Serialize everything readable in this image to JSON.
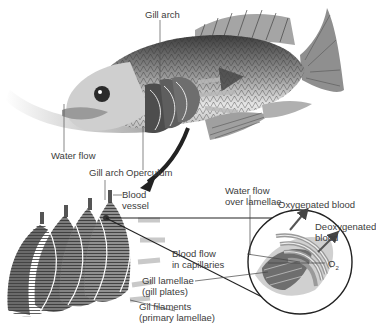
{
  "diagram": {
    "color_scheme": "grayscale",
    "top_cut_text": "fish ... wheels ... and ... gills",
    "labels": {
      "gill_arch_top": "Gill arch",
      "water_flow": "Water flow",
      "operculum": "Operculum",
      "gill_arch_bottom": "Gill arch",
      "blood_vessel_line1": "Blood",
      "blood_vessel_line2": "vessel",
      "water_flow_lamellae_line1": "Water flow",
      "water_flow_lamellae_line2": "over lamellae",
      "oxygenated_blood": "Oxygenated blood",
      "deoxygenated_line1": "Deoxygenated",
      "deoxygenated_line2": "blood",
      "blood_flow_line1": "Blood flow",
      "blood_flow_line2": "in capillaries",
      "o2": "O",
      "o2_sub": "2",
      "gill_lamellae_line1": "Gill lamellae",
      "gill_lamellae_line2": "(gill plates)",
      "gill_filaments_line1": "Gil filaments",
      "gill_filaments_line2": "(primary lamellae)"
    },
    "colors": {
      "background": "#ffffff",
      "fish_dark": "#3a3a3a",
      "fish_mid": "#8a8a8a",
      "fish_light": "#d8d8d8",
      "arrow": "#2a2a2a",
      "flow_arrows": "#b5b5b5",
      "label_text": "#3c3c3c"
    }
  }
}
